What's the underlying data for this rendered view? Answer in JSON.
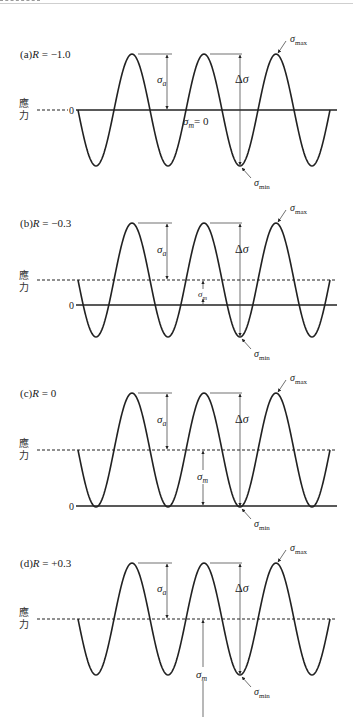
{
  "figure": {
    "width": 353,
    "height": 717,
    "ink_color": "#222222",
    "background": "#ffffff",
    "x_start": 78,
    "x_end": 330,
    "period": 72,
    "axis_label": "應力",
    "zero_label": "0",
    "symbols": {
      "sigma_a": "σ",
      "sigma_a_sub": "a",
      "sigma_m": "σ",
      "sigma_m_sub": "m",
      "delta_sigma": "Δσ",
      "sigma_max": "σ",
      "sigma_max_sub": "max",
      "sigma_min": "σ",
      "sigma_min_sub": "min",
      "sigma_m_zero": "= 0"
    },
    "panels": [
      {
        "id": "a",
        "title_prefix": "(a)",
        "title_R": "R",
        "title_value": " = −1.0",
        "R": -1.0,
        "peak_y": 54,
        "mean_y": 110,
        "zero_y": 110,
        "title_y": 58,
        "label_y": 110,
        "mean_dashed": false
      },
      {
        "id": "b",
        "title_prefix": "(b)",
        "title_R": "R",
        "title_value": " = −0.3",
        "R": -0.3,
        "peak_y": 223,
        "mean_y": 280,
        "zero_y": 305,
        "title_y": 227,
        "label_y": 282,
        "mean_dashed": true
      },
      {
        "id": "c",
        "title_prefix": "(c)",
        "title_R": "R",
        "title_value": " = 0",
        "R": 0,
        "peak_y": 393,
        "mean_y": 450,
        "zero_y": 506,
        "title_y": 397,
        "label_y": 450,
        "mean_dashed": true
      },
      {
        "id": "d",
        "title_prefix": "(d)",
        "title_R": "R",
        "title_value": " = +0.3",
        "R": 0.3,
        "peak_y": 563,
        "mean_y": 619,
        "zero_y": null,
        "title_y": 567,
        "label_y": 619,
        "mean_dashed": true
      }
    ]
  }
}
